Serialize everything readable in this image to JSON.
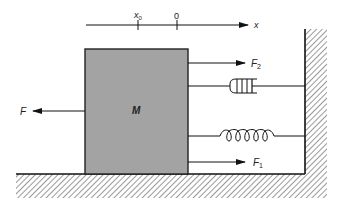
{
  "diagram": {
    "type": "mass-spring-damper",
    "axis": {
      "label": "x",
      "ticks": [
        {
          "label": "x",
          "subscript": "0"
        },
        {
          "label": "0",
          "subscript": ""
        }
      ]
    },
    "mass": {
      "label": "M",
      "fill": "#a3a3a3"
    },
    "forces": {
      "applied": {
        "label": "F",
        "subscript": "",
        "direction": "left"
      },
      "damper_force": {
        "label": "F",
        "subscript": "2",
        "direction": "right"
      },
      "spring_force": {
        "label": "F",
        "subscript": "1",
        "direction": "right"
      }
    },
    "components": {
      "damper": "damper",
      "spring": "spring",
      "wall": "fixed wall",
      "ground": "ground"
    },
    "colors": {
      "stroke": "#1a1a1a",
      "hatch": "#555555",
      "mass_fill": "#a3a3a3"
    }
  }
}
